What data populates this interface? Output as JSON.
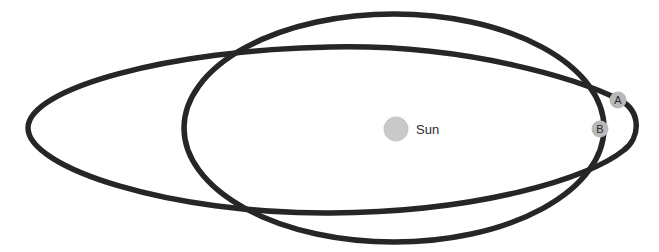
{
  "diagram": {
    "title": "",
    "orbits": [
      {
        "id": "orbit-elongated",
        "description": "highly elongated elliptical orbit"
      },
      {
        "id": "orbit-rounder",
        "description": "less elongated elliptical orbit"
      }
    ],
    "sun": {
      "label": "Sun",
      "color": "#c9c9c9"
    },
    "points": [
      {
        "label": "A",
        "color": "#b9b9b9"
      },
      {
        "label": "B",
        "color": "#b9b9b9"
      }
    ],
    "colors": {
      "orbit_stroke": "#262626",
      "background": "#ffffff"
    }
  }
}
